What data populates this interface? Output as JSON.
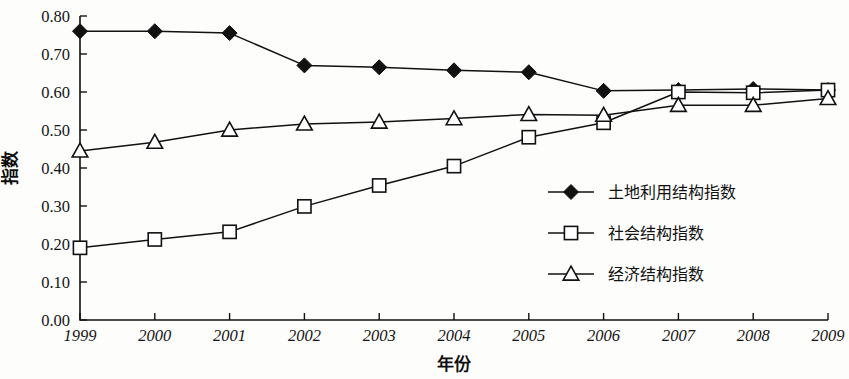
{
  "chart_data": {
    "type": "line",
    "title": "",
    "xlabel": "年份",
    "ylabel": "指数",
    "x": [
      "1999",
      "2000",
      "2001",
      "2002",
      "2003",
      "2004",
      "2005",
      "2006",
      "2007",
      "2008",
      "2009"
    ],
    "categories": [
      "1999",
      "2000",
      "2001",
      "2002",
      "2003",
      "2004",
      "2005",
      "2006",
      "2007",
      "2008",
      "2009"
    ],
    "xlim": [
      1999,
      2009
    ],
    "ylim": [
      0.0,
      0.8
    ],
    "ytick_labels": [
      "0.00",
      "0.10",
      "0.20",
      "0.30",
      "0.40",
      "0.50",
      "0.60",
      "0.70",
      "0.80"
    ],
    "ytick_values": [
      0.0,
      0.1,
      0.2,
      0.3,
      0.4,
      0.5,
      0.6,
      0.7,
      0.8
    ],
    "grid": false,
    "legend_position": "center-right",
    "series": [
      {
        "name": "土地利用结构指数",
        "marker": "filled-diamond",
        "values": [
          0.76,
          0.76,
          0.755,
          0.67,
          0.665,
          0.657,
          0.652,
          0.603,
          0.605,
          0.608,
          0.605
        ]
      },
      {
        "name": "社会结构指数",
        "marker": "open-square",
        "values": [
          0.19,
          0.212,
          0.232,
          0.299,
          0.354,
          0.405,
          0.481,
          0.519,
          0.6,
          0.598,
          0.605
        ]
      },
      {
        "name": "经济结构指数",
        "marker": "open-triangle",
        "values": [
          0.445,
          0.468,
          0.5,
          0.516,
          0.521,
          0.53,
          0.541,
          0.539,
          0.565,
          0.565,
          0.583
        ]
      }
    ]
  },
  "axes": {
    "y_label": "指数",
    "x_label": "年份"
  },
  "legend": {
    "items": [
      {
        "label": "土地利用结构指数",
        "marker": "filled-diamond"
      },
      {
        "label": "社会结构指数",
        "marker": "open-square"
      },
      {
        "label": "经济结构指数",
        "marker": "open-triangle"
      }
    ]
  },
  "colors": {
    "ink": "#111111",
    "background": "#fdfdfc",
    "marker_fill_open": "#ffffff"
  }
}
